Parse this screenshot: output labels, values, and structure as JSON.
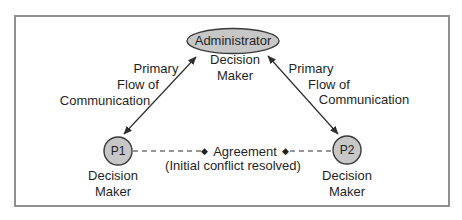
{
  "diagram": {
    "nodes": {
      "administrator": {
        "label": "Administrator",
        "role_line1": "Decision",
        "role_line2": "Maker"
      },
      "p1": {
        "label": "P1",
        "role_line1": "Decision",
        "role_line2": "Maker"
      },
      "p2": {
        "label": "P2",
        "role_line1": "Decision",
        "role_line2": "Maker"
      }
    },
    "edges": {
      "left_flow": {
        "line1": "Primary",
        "line2": "Flow of",
        "line3": "Communication"
      },
      "right_flow": {
        "line1": "Primary",
        "line2": "Flow of",
        "line3": "Communication"
      },
      "agreement": {
        "diamond": "◆",
        "label": "Agreement",
        "subtitle": "(Initial conflict resolved)"
      }
    },
    "colors": {
      "node_fill": "#c7c7c7",
      "node_stroke": "#3a3a3a",
      "line": "#2e2e2e",
      "frame": "#8f8f8f",
      "text": "#1f1f1f",
      "background": "#ffffff"
    }
  }
}
